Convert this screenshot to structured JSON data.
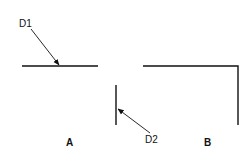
{
  "diagram": {
    "labels": {
      "d1": "D1",
      "d2": "D2",
      "a": "A",
      "b": "B"
    },
    "colors": {
      "stroke": "#111111",
      "background": "#ffffff"
    }
  }
}
